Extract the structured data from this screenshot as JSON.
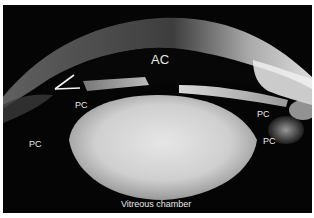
{
  "image": {
    "description": "Ultrasound biomicroscopy cross-section of the anterior eye segment",
    "background_color": "#050505",
    "border_color": "#ffffff"
  },
  "labels": {
    "anterior_chamber": "AC",
    "posterior_chamber_1": "PC",
    "posterior_chamber_2": "PC",
    "posterior_chamber_3": "PC",
    "posterior_chamber_4": "PC",
    "vitreous_chamber": "Vitreous chamber"
  },
  "annotations": {
    "angle_marker": "angle-marker-icon"
  }
}
